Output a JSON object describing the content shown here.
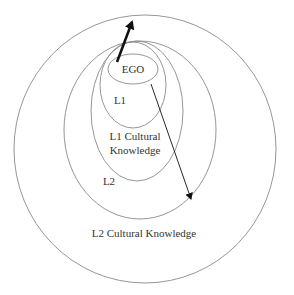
{
  "diagram": {
    "labels": {
      "ego": "EGO",
      "l1": "L1",
      "l1_cultural_line1": "L1 Cultural",
      "l1_cultural_line2": "Knowledge",
      "l2": "L2",
      "l2_cultural": "L2 Cultural Knowledge"
    },
    "colors": {
      "line": "#8a8a8a",
      "arrow": "#111111",
      "text": "#333333"
    }
  }
}
